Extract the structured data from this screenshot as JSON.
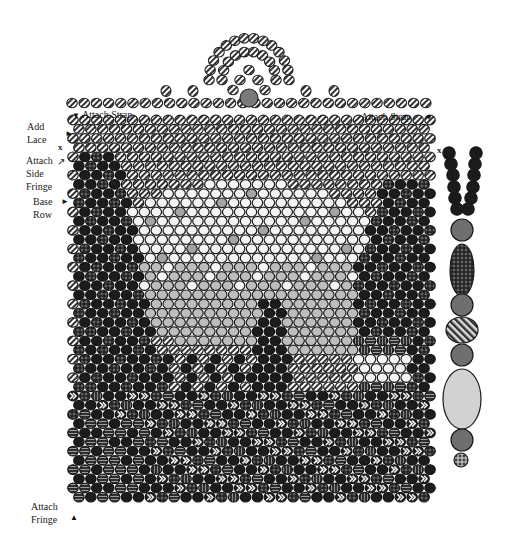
{
  "labels": {
    "add_lace": [
      "Add",
      "Lace"
    ],
    "attach_strap_left": "Attach Strap",
    "attach_strap_right": "Attach Strap",
    "attach_side_fringe": [
      "Attach",
      "Side",
      "Fringe"
    ],
    "base_row": [
      "Base",
      "Row"
    ],
    "attach_fringe": [
      "Attach",
      "Fringe"
    ],
    "x_marker": "x"
  },
  "arrows": {
    "down": "▼",
    "right": "►",
    "up": "▲",
    "diag": "↖"
  },
  "bead_types": {
    "stripe": {
      "fill": "#e6e6e6",
      "stroke": "#2a2a2a",
      "pattern": "diagonal-stripes"
    },
    "dark": {
      "fill": "#1c1c1c",
      "stroke": "#111111",
      "pattern": "solid"
    },
    "dark_dotted": {
      "fill": "#222222",
      "stroke": "#111111",
      "pattern": "cross-dots"
    },
    "white": {
      "fill": "#f2f2f2",
      "stroke": "#1a1a1a",
      "pattern": "solid"
    },
    "light_gray": {
      "fill": "#bdbdbd",
      "stroke": "#1a1a1a",
      "pattern": "solid"
    },
    "mid_gray": {
      "fill": "#a8a8a8",
      "stroke": "#1a1a1a",
      "pattern": "solid"
    },
    "hstripe": {
      "fill": "#3a3a3a",
      "stroke": "#111111",
      "pattern": "horizontal-lines"
    },
    "vstripe": {
      "fill": "#3a3a3a",
      "stroke": "#111111",
      "pattern": "vertical-lines"
    },
    "chevron": {
      "fill": "#1e1e1e",
      "stroke": "#111111",
      "pattern": "chevrons"
    },
    "accent": {
      "fill": "#7a7a7a",
      "stroke": "#222222",
      "pattern": "speckle"
    }
  },
  "grid": {
    "left": 68,
    "top": 115,
    "cols": 31,
    "rows": 42,
    "col_spacing": 11.9,
    "row_spacing": 9.2,
    "bead_w": 10.5,
    "bead_h": 9.6
  },
  "strap_loop": {
    "center_x": 249,
    "base_y": 75,
    "accent_bead": "gray-speckled"
  },
  "fringe_strand": {
    "beads": [
      {
        "type": "dark-pair",
        "count": 6
      },
      {
        "type": "gray-round"
      },
      {
        "type": "dotted-oval"
      },
      {
        "type": "gray-round"
      },
      {
        "type": "striped-oval"
      },
      {
        "type": "gray-round"
      },
      {
        "type": "light-large-oval"
      },
      {
        "type": "gray-round"
      },
      {
        "type": "cross-hatched-small"
      }
    ]
  }
}
